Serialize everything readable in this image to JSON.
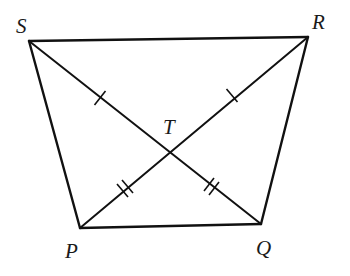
{
  "diagram": {
    "type": "quadrilateral-with-diagonals",
    "vertices": {
      "S": {
        "label": "S",
        "x": 29,
        "y": 41,
        "label_x": 16,
        "label_y": 33
      },
      "R": {
        "label": "R",
        "x": 308,
        "y": 37,
        "label_x": 312,
        "label_y": 29
      },
      "P": {
        "label": "P",
        "x": 80,
        "y": 228,
        "label_x": 65,
        "label_y": 258
      },
      "Q": {
        "label": "Q",
        "x": 261,
        "y": 224,
        "label_x": 256,
        "label_y": 255
      }
    },
    "intersection": {
      "label": "T",
      "x": 169,
      "y": 152,
      "label_x": 163,
      "label_y": 134
    },
    "sides": [
      "SR",
      "RQ",
      "QP",
      "PS"
    ],
    "diagonals": [
      "SQ",
      "PR"
    ],
    "tick_marks": [
      {
        "segment": "ST",
        "count": 1
      },
      {
        "segment": "TR",
        "count": 1
      },
      {
        "segment": "PT",
        "count": 2
      },
      {
        "segment": "TQ",
        "count": 2
      }
    ],
    "colors": {
      "stroke": "#111111",
      "background": "#ffffff"
    }
  }
}
